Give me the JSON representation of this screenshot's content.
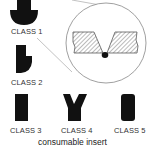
{
  "diagram": {
    "title": "consumable insert",
    "classes": [
      {
        "label": "CLASS 1",
        "shape": "mushroom-insert"
      },
      {
        "label": "CLASS 2",
        "shape": "asymmetric-insert"
      },
      {
        "label": "CLASS 3",
        "shape": "rectangular-insert"
      },
      {
        "label": "CLASS 4",
        "shape": "y-shaped-insert"
      },
      {
        "label": "CLASS 5",
        "shape": "rounded-rectangular-insert"
      }
    ],
    "detail_view": {
      "description": "circular magnified view of V-groove joint with insert at root"
    },
    "colors": {
      "shape_fill": "#111111",
      "line": "#888888",
      "hatch": "#555555"
    }
  }
}
